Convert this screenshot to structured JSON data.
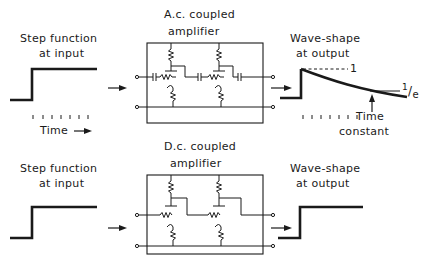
{
  "top_row": {
    "input_label_line1": "Step function",
    "input_label_line2": "at input",
    "time_label": "Time",
    "amplifier_label_line1": "A.c. coupled",
    "amplifier_label_line2": "amplifier",
    "output_label_line1": "Wave-shape",
    "output_label_line2": "at output",
    "level_one": "1",
    "level_inv_e_num": "1",
    "level_inv_e_den": "e",
    "time_constant_line1": "Time",
    "time_constant_line2": "constant"
  },
  "bottom_row": {
    "input_label_line1": "Step function",
    "input_label_line2": "at input",
    "amplifier_label_line1": "D.c. coupled",
    "amplifier_label_line2": "amplifier",
    "output_label_line1": "Wave-shape",
    "output_label_line2": "at output"
  },
  "colors": {
    "ink": "#1a1a1a",
    "background": "#ffffff"
  }
}
